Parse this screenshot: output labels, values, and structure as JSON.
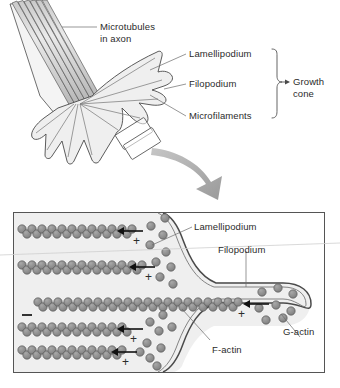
{
  "figure": {
    "domain_type": "diagram",
    "top_panel": {
      "labels": {
        "microtubules_line1": "Microtubules",
        "microtubules_line2": "in axon",
        "lamellipodium": "Lamellipodium",
        "filopodium": "Filopodium",
        "microfilaments": "Microfilaments",
        "growth_cone_line1": "Growth",
        "growth_cone_line2": "cone"
      },
      "microtubule_count": 6,
      "brace_groups": [
        "Lamellipodium",
        "Filopodium",
        "Microfilaments"
      ],
      "brace_target": "Growth cone"
    },
    "bottom_panel": {
      "labels": {
        "lamellipodium": "Lamellipodium",
        "filopodium": "Filopodium",
        "f_actin": "F-actin",
        "g_actin": "G-actin"
      },
      "polarity_minus": "−",
      "polarity_plus_symbol": "+",
      "filaments": [
        {
          "id": "f1",
          "y": 232,
          "x_start": 20,
          "x_end": 136,
          "plus_label": "+",
          "minus_label": null,
          "arrow": true
        },
        {
          "id": "f2",
          "y": 268,
          "x_start": 20,
          "x_end": 148,
          "plus_label": "+",
          "minus_label": null,
          "arrow": true
        },
        {
          "id": "f3",
          "y": 305,
          "x_start": 36,
          "x_end": 238,
          "plus_label": "+",
          "minus_label": "−",
          "arrow": true
        },
        {
          "id": "f4",
          "y": 330,
          "x_start": 20,
          "x_end": 132,
          "plus_label": "+",
          "minus_label": null,
          "arrow": true
        },
        {
          "id": "f5",
          "y": 353,
          "x_start": 20,
          "x_end": 124,
          "plus_label": "+",
          "minus_label": null,
          "arrow": true
        }
      ],
      "g_actin_clusters": 3,
      "plus_end_count": 5,
      "minus_end_count": 1
    },
    "colors": {
      "outline": "#3a3a3a",
      "membrane": "#4a4a4a",
      "cytoplasm": "#efefef",
      "actin_bead_fill": "#8d8d8d",
      "actin_bead_stroke": "#4f4f4f",
      "microtubule_fill": "#d6d6d6",
      "arrow_gray": "#a8a8a8",
      "text": "#2b2b2b",
      "panel_border": "#555555",
      "background": "#ffffff"
    }
  }
}
